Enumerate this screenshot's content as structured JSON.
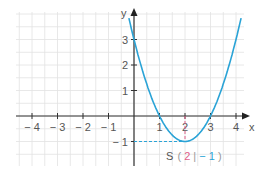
{
  "chart_data": {
    "type": "line",
    "title": "",
    "function": "f(x) = (x - 2)^2 - 1",
    "xlabel": "x",
    "ylabel": "y",
    "xlim": [
      -4.5,
      4.6
    ],
    "ylim": [
      -1.6,
      4.7
    ],
    "grid": true,
    "grid_step": 0.5,
    "x_ticks": [
      -4,
      -3,
      -2,
      -1,
      1,
      2,
      3,
      4
    ],
    "x_tick_labels": [
      "− 4",
      "− 3",
      "− 2",
      "− 1",
      "1",
      "2",
      "3",
      "4"
    ],
    "y_ticks": [
      3,
      2,
      1,
      -1
    ],
    "y_tick_labels": [
      "3",
      "2",
      "1",
      "− 1"
    ],
    "series": [
      {
        "name": "parabola",
        "color": "#2aa3d6",
        "x": [
          -0.15,
          0,
          0.5,
          1,
          1.5,
          2,
          2.5,
          3,
          3.5,
          4,
          4.15
        ],
        "y": [
          3.62,
          3,
          1.25,
          0,
          -0.75,
          -1,
          -0.75,
          0,
          1.25,
          3,
          3.62
        ]
      }
    ],
    "annotations": [
      {
        "type": "vertex",
        "label": "S",
        "x": 2,
        "y": -1,
        "text_x": "2",
        "text_y": "− 1"
      },
      {
        "type": "dashed-line",
        "from": [
          0,
          -1
        ],
        "to": [
          2,
          -1
        ],
        "color": "#2aa3d6"
      },
      {
        "type": "dashed-line",
        "from": [
          2,
          0
        ],
        "to": [
          2,
          -1
        ],
        "color": "#e0608a"
      }
    ]
  },
  "labels": {
    "x_axis": "x",
    "y_axis": "y",
    "vertex_prefix": "S",
    "vertex_x": "2",
    "vertex_y": "− 1",
    "x_ticks": [
      "− 4",
      "− 3",
      "− 2",
      "− 1",
      "1",
      "2",
      "3",
      "4"
    ],
    "y_ticks": [
      "3",
      "2",
      "1",
      "− 1"
    ]
  },
  "colors": {
    "curve": "#2aa3d6",
    "highlight": "#e0608a",
    "axis": "#333333",
    "grid": "#e2e2e2"
  }
}
